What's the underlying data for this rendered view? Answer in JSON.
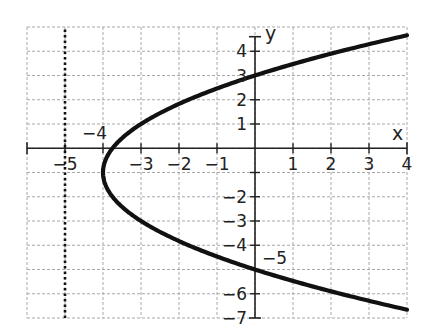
{
  "chart_data": {
    "type": "line",
    "title": "",
    "xlabel": "x",
    "ylabel": "y",
    "xlim": [
      -6,
      4
    ],
    "ylim": [
      -7,
      5
    ],
    "grid": true,
    "grid_style": "dashed",
    "x_ticks": [
      -5,
      -3,
      -2,
      -1,
      1,
      2,
      3,
      4
    ],
    "x_tick_labels": [
      "−5",
      "−3",
      "−2",
      "−1",
      "1",
      "2",
      "3",
      "4"
    ],
    "y_ticks": [
      4,
      3,
      2,
      1,
      -2,
      -3,
      -4,
      -6,
      -7
    ],
    "y_tick_labels": [
      "4",
      "3",
      "2",
      "1",
      "−2",
      "−3",
      "−4",
      "−6",
      "−7"
    ],
    "annotations": [
      {
        "text": "−4",
        "x": -4,
        "y": 0,
        "note": "vertex x-intercept label"
      },
      {
        "text": "−5",
        "x": 0,
        "y": -5,
        "note": "y-intercept label"
      }
    ],
    "series": [
      {
        "name": "parabola",
        "equation": "(y+1)^2 = 4(x+4)",
        "vertex": [
          -4,
          -1
        ],
        "focus": [
          -3,
          -1
        ],
        "points": [
          [
            4,
            4.66
          ],
          [
            3,
            4.29
          ],
          [
            2,
            3.9
          ],
          [
            1,
            3.47
          ],
          [
            0,
            3
          ],
          [
            -1,
            2.46
          ],
          [
            -2,
            1.83
          ],
          [
            -3,
            1
          ],
          [
            -3.75,
            0
          ],
          [
            -4,
            -1
          ],
          [
            -3.75,
            -2
          ],
          [
            -3,
            -3
          ],
          [
            -2,
            -3.83
          ],
          [
            -1,
            -4.46
          ],
          [
            0,
            -5
          ],
          [
            1,
            -5.47
          ],
          [
            2,
            -5.9
          ],
          [
            3,
            -6.29
          ],
          [
            4,
            -6.66
          ]
        ],
        "color": "#111111",
        "style": "solid"
      },
      {
        "name": "directrix",
        "equation": "x = -5",
        "points": [
          [
            -5,
            -7
          ],
          [
            -5,
            5
          ]
        ],
        "color": "#111111",
        "style": "dotted"
      }
    ]
  },
  "labels": {
    "x_axis": "x",
    "y_axis": "y",
    "vertex_label": "−4",
    "y_intercept_label": "−5"
  }
}
